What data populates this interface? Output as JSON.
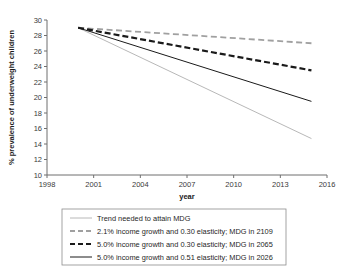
{
  "figure": {
    "cut_off_title": "",
    "background": "#ffffff"
  },
  "axes": {
    "ylabel": "% prevalence of underweight children",
    "xlabel": "year",
    "ytick_labels": [
      "30",
      "28",
      "26",
      "24",
      "22",
      "20",
      "18",
      "16",
      "14",
      "12",
      "10"
    ],
    "xtick_labels": [
      "1998",
      "2001",
      "2004",
      "2007",
      "2010",
      "2013",
      "2016"
    ]
  },
  "legend": {
    "entries": [
      {
        "label": "Trend needed to attain MDG",
        "style": "solid",
        "color": "#b8b8b8",
        "width": 1.0
      },
      {
        "label": "2.1% income growth and 0.30 elasticity; MDG in 2109",
        "style": "dashed",
        "color": "#a0a0a0",
        "width": 1.8
      },
      {
        "label": "5.0% income growth and 0.30 elasticity; MDG in 2065",
        "style": "dashed",
        "color": "#1a1a1a",
        "width": 2.2
      },
      {
        "label": "5.0% income growth and 0.51 elasticity; MDG in 2026",
        "style": "solid",
        "color": "#1a1a1a",
        "width": 1.0
      }
    ]
  },
  "chart_data": {
    "type": "line",
    "title": "",
    "xlabel": "year",
    "ylabel": "% prevalence of underweight children",
    "xlim": [
      1998,
      2016
    ],
    "ylim": [
      10,
      30
    ],
    "xticks": [
      1998,
      2001,
      2004,
      2007,
      2010,
      2013,
      2016
    ],
    "yticks": [
      10,
      12,
      14,
      16,
      18,
      20,
      22,
      24,
      26,
      28,
      30
    ],
    "grid": false,
    "legend_position": "below-axes",
    "series": [
      {
        "name": "Trend needed to attain MDG",
        "style": "solid",
        "color": "#b8b8b8",
        "x": [
          2000,
          2015
        ],
        "values": [
          29.0,
          14.7
        ]
      },
      {
        "name": "2.1% income growth and 0.30 elasticity; MDG in 2109",
        "style": "dashed",
        "color": "#a0a0a0",
        "x": [
          2000,
          2015
        ],
        "values": [
          29.0,
          27.0
        ]
      },
      {
        "name": "5.0% income growth and 0.30 elasticity; MDG in 2065",
        "style": "dashed",
        "color": "#1a1a1a",
        "x": [
          2000,
          2015
        ],
        "values": [
          29.0,
          23.5
        ]
      },
      {
        "name": "5.0% income growth and 0.51 elasticity; MDG in 2026",
        "style": "solid",
        "color": "#1a1a1a",
        "x": [
          2000,
          2015
        ],
        "values": [
          29.0,
          19.5
        ]
      }
    ]
  }
}
